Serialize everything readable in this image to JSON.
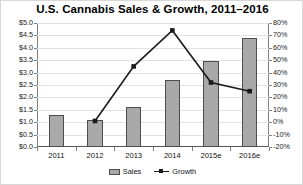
{
  "chart_data": {
    "type": "bar",
    "title": "U.S. Cannabis Sales & Growth, 2011–2016",
    "xlabel": "",
    "ylabel": "",
    "categories": [
      "2011",
      "2012",
      "2013",
      "2014",
      "2015e",
      "2016e"
    ],
    "grid": true,
    "legend_position": "bottom",
    "series": [
      {
        "name": "Sales",
        "type": "bar",
        "axis": "left",
        "unit": "billion USD",
        "values": [
          1.3,
          1.1,
          1.6,
          2.7,
          3.45,
          4.4
        ],
        "color": "#a9a9a9"
      },
      {
        "name": "Growth",
        "type": "line",
        "axis": "right",
        "unit": "percent",
        "values": [
          null,
          1,
          45,
          74,
          32,
          25
        ],
        "color": "#1a1a1a"
      }
    ],
    "left_axis": {
      "ylim": [
        0,
        5.0
      ],
      "tick_step": 0.5,
      "ticks": [
        "$0.0",
        "$0.5",
        "$1.0",
        "$1.5",
        "$2.0",
        "$2.5",
        "$3.0",
        "$3.5",
        "$4.0",
        "$4.5",
        "$5.0"
      ]
    },
    "right_axis": {
      "ylim": [
        -20,
        80
      ],
      "tick_step": 10,
      "ticks": [
        "-20%",
        "-10%",
        "0%",
        "10%",
        "20%",
        "30%",
        "40%",
        "50%",
        "60%",
        "70%",
        "80%"
      ]
    },
    "legend": [
      {
        "label": "Sales",
        "marker": "bar-swatch"
      },
      {
        "label": "Growth",
        "marker": "line-square-marker"
      }
    ]
  }
}
